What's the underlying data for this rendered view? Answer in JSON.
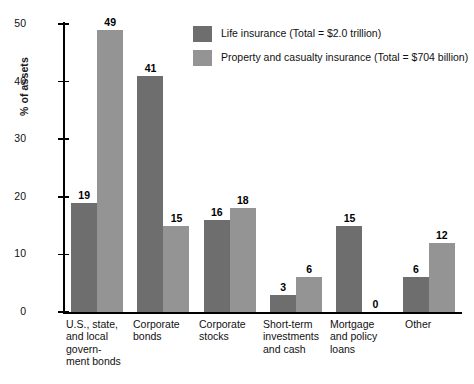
{
  "chart_data": {
    "type": "bar",
    "title": "",
    "xlabel": "",
    "ylabel": "% of assets",
    "ylim": [
      0,
      50
    ],
    "yticks": [
      0,
      10,
      20,
      30,
      40,
      50
    ],
    "grid": false,
    "legend_position": "top-right",
    "categories": [
      "U.S., state, and local govern- ment bonds",
      "Corporate bonds",
      "Corporate stocks",
      "Short-term investments and cash",
      "Mortgage and policy loans",
      "Other"
    ],
    "category_lines": [
      [
        "U.S., state,",
        "and local",
        "govern-",
        "ment bonds"
      ],
      [
        "Corporate",
        "bonds"
      ],
      [
        "Corporate",
        "stocks"
      ],
      [
        "Short-term",
        "investments",
        "and cash"
      ],
      [
        "Mortgage",
        "and policy",
        "loans"
      ],
      [
        "Other"
      ]
    ],
    "series": [
      {
        "name": "Life insurance (Total = $2.0 trillion)",
        "color": "#6e6e6e",
        "values": [
          19,
          41,
          16,
          3,
          15,
          6
        ]
      },
      {
        "name": "Property and casualty insurance (Total = $704 billion)",
        "color": "#949494",
        "values": [
          49,
          15,
          18,
          6,
          0,
          12
        ]
      }
    ]
  },
  "legend": {
    "items": [
      {
        "label": "Life insurance (Total = $2.0 trillion)",
        "color": "#6e6e6e"
      },
      {
        "label": "Property and casualty insurance (Total = $704 billion)",
        "color": "#949494"
      }
    ]
  },
  "axis": {
    "y_title": "% of assets",
    "y_ticks": [
      "0",
      "10",
      "20",
      "30",
      "40",
      "50"
    ]
  }
}
